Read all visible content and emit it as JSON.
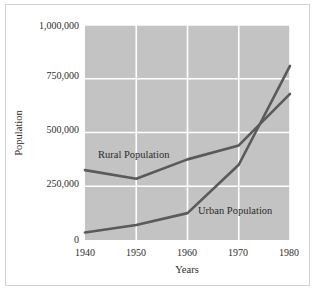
{
  "chart_data": {
    "type": "line",
    "title": "",
    "xlabel": "Years",
    "ylabel": "Population",
    "categories": [
      "1940",
      "1950",
      "1960",
      "1970",
      "1980"
    ],
    "x": [
      1940,
      1950,
      1960,
      1970,
      1980
    ],
    "xlim": [
      1940,
      1980
    ],
    "ylim": [
      0,
      1000000
    ],
    "ytick_labels": [
      "0",
      "250,000",
      "500,000",
      "750,000",
      "1,000,000"
    ],
    "ytick_values": [
      0,
      250000,
      500000,
      750000,
      1000000
    ],
    "xtick_labels": [
      "1940",
      "1950",
      "1960",
      "1970",
      "1980"
    ],
    "grid": true,
    "grid_color": "#ffffff",
    "plot_background": "#c3c3c3",
    "legend": "inline-annotations",
    "series": [
      {
        "name": "Rural Population",
        "label": "Rural Population",
        "color": "#5a5a5a",
        "values": [
          325000,
          285000,
          375000,
          440000,
          680000
        ]
      },
      {
        "name": "Urban Population",
        "label": "Urban Population",
        "color": "#5a5a5a",
        "values": [
          35000,
          70000,
          125000,
          350000,
          810000
        ]
      }
    ],
    "annotations": [
      {
        "text": "Rural Population",
        "x": 1942.6,
        "y": 420000
      },
      {
        "text": "Urban Population",
        "x": 1966.2,
        "y": 150000
      }
    ]
  },
  "figure": {
    "border_color": "#d2d2d2",
    "background": "#ffffff"
  }
}
